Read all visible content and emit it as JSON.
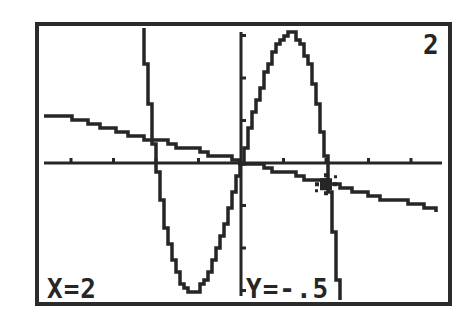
{
  "calculator": {
    "screen": "graph",
    "graph_number": "2",
    "trace": {
      "x_label": "X=2",
      "y_label": "Y=-.5",
      "x": 2,
      "y": -0.5
    }
  },
  "colors": {
    "background": "#ffffff",
    "ink": "#262626",
    "frame": "#2b2b2b"
  },
  "window": {
    "xmin": -4.7,
    "xmax": 4.7,
    "ymin": -3.1,
    "ymax": 3.1,
    "xscl": 1,
    "yscl": 1
  },
  "chart_data": {
    "type": "line",
    "title": "",
    "xlabel": "",
    "ylabel": "",
    "xlim": [
      -4.7,
      4.7
    ],
    "ylim": [
      -3.1,
      3.1
    ],
    "grid": false,
    "axes": true,
    "tick_spacing": {
      "x": 1,
      "y": 1
    },
    "series": [
      {
        "name": "Y1 (cubic)",
        "expression": "4x - x^3",
        "x": [
          -2.35,
          -2.2,
          -2.0,
          -1.8,
          -1.6,
          -1.4,
          -1.2,
          -1.155,
          -1.0,
          -0.8,
          -0.6,
          -0.4,
          -0.2,
          0,
          0.2,
          0.4,
          0.6,
          0.8,
          1.0,
          1.155,
          1.2,
          1.4,
          1.6,
          1.8,
          2.0,
          2.2,
          2.35
        ],
        "values": [
          3.58,
          1.85,
          0,
          -1.37,
          -2.3,
          -2.86,
          -3.07,
          -3.08,
          -3.0,
          -2.69,
          -2.18,
          -1.54,
          -0.79,
          0,
          0.79,
          1.54,
          2.18,
          2.69,
          3.0,
          3.08,
          3.07,
          2.86,
          2.3,
          1.37,
          0,
          -1.85,
          -3.58
        ]
      },
      {
        "name": "Y2 (line)",
        "expression": "-x/4",
        "x": [
          -4.6,
          -2,
          0,
          2,
          4.6
        ],
        "values": [
          1.15,
          0.5,
          0,
          -0.5,
          -1.15
        ]
      }
    ],
    "annotations": [
      {
        "type": "trace-cursor",
        "x": 2,
        "y": -0.5
      },
      {
        "type": "text",
        "text": "X=2",
        "position": "bottom-left"
      },
      {
        "type": "text",
        "text": "Y=-.5",
        "position": "bottom-center"
      },
      {
        "type": "text",
        "text": "2",
        "position": "top-right"
      }
    ]
  }
}
